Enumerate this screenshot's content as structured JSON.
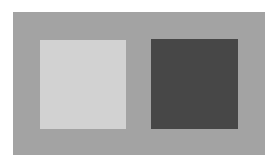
{
  "figure": {
    "background_color": "#a3a3a3",
    "squares": [
      {
        "name": "light-square",
        "color": "#d2d2d2"
      },
      {
        "name": "dark-square",
        "color": "#474747"
      }
    ]
  }
}
